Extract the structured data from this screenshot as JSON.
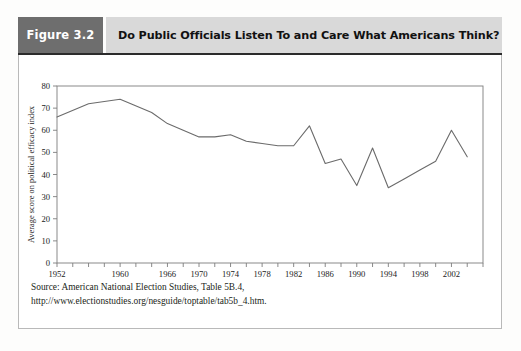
{
  "figure": {
    "number_label": "Figure 3.2",
    "title": "Do Public Officials Listen To and Care What Americans Think?",
    "source_note": "Source: American National Election Studies, Table 5B.4, http://www.electionstudies.org/nesguide/toptable/tab5b_4.htm."
  },
  "colors": {
    "figure_number_bg": "#6e6e6e",
    "title_bg": "#d9d9d9",
    "line": "#6b6b6b",
    "axis": "#7d7d7d",
    "panel_border": "#b9b9b9",
    "text": "#1a1a1a"
  },
  "chart_data": {
    "type": "line",
    "title": "Do Public Officials Listen To and Care What Americans Think?",
    "xlabel": "",
    "ylabel": "Average score on political efficacy index",
    "xlim": [
      1952,
      2006
    ],
    "ylim": [
      0,
      80
    ],
    "ytick_step": 10,
    "yticks": [
      0,
      10,
      20,
      30,
      40,
      50,
      60,
      70,
      80
    ],
    "ytick_labels": [
      "0",
      "10",
      "20",
      "30",
      "40",
      "50",
      "60",
      "70",
      "80"
    ],
    "xticks": [
      1952,
      1954,
      1956,
      1958,
      1960,
      1962,
      1964,
      1966,
      1968,
      1970,
      1972,
      1974,
      1976,
      1978,
      1980,
      1982,
      1984,
      1986,
      1988,
      1990,
      1992,
      1994,
      1996,
      1998,
      2000,
      2002,
      2004,
      2006
    ],
    "xtick_labels_shown": [
      "1952",
      "1960",
      "1966",
      "1970",
      "1974",
      "1978",
      "1982",
      "1986",
      "1990",
      "1994",
      "1998",
      "2002"
    ],
    "xtick_label_years": [
      1952,
      1960,
      1966,
      1970,
      1974,
      1978,
      1982,
      1986,
      1990,
      1994,
      1998,
      2002
    ],
    "grid": false,
    "legend": false,
    "series": [
      {
        "name": "Average score on political efficacy index",
        "x": [
          1952,
          1956,
          1960,
          1964,
          1966,
          1968,
          1970,
          1972,
          1974,
          1976,
          1978,
          1980,
          1982,
          1984,
          1986,
          1988,
          1990,
          1992,
          1994,
          1996,
          1998,
          2000,
          2002,
          2004
        ],
        "values": [
          66,
          72,
          74,
          68,
          63,
          60,
          57,
          57,
          58,
          55,
          54,
          53,
          53,
          62,
          45,
          47,
          35,
          52,
          34,
          38,
          42,
          46,
          60,
          48
        ]
      }
    ]
  }
}
